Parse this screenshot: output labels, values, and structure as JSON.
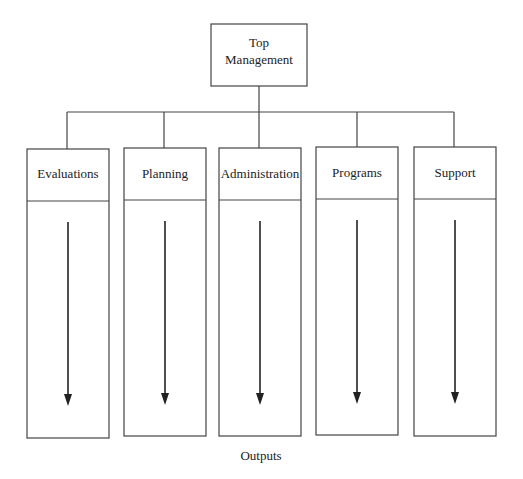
{
  "diagram": {
    "top": {
      "line1": "Top",
      "line2": "Management"
    },
    "units": [
      {
        "label": "Evaluations"
      },
      {
        "label": "Planning"
      },
      {
        "label": "Administration"
      },
      {
        "label": "Programs"
      },
      {
        "label": "Support"
      }
    ],
    "footer": "Outputs",
    "colors": {
      "stroke": "#444444",
      "arrow": "#222222"
    }
  }
}
